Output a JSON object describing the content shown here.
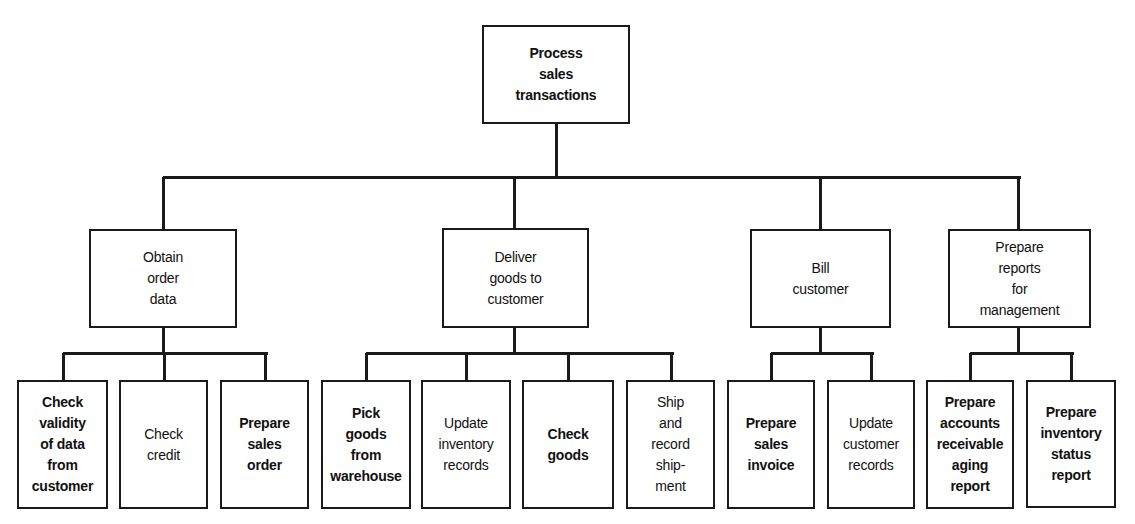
{
  "diagram": {
    "type": "hierarchy-chart",
    "line_color": "#1a1a1a",
    "root": {
      "label": "Process\nsales\ntransactions",
      "box": [
        482,
        25,
        148,
        99
      ]
    },
    "level1": [
      {
        "label": "Obtain\norder\ndata",
        "box": [
          89,
          229,
          148,
          99
        ],
        "connector_x": 163,
        "children": [
          {
            "label": "Check\nvalidity\nof data\nfrom\ncustomer",
            "box": [
              17,
              380,
              91,
              129
            ],
            "bold": true
          },
          {
            "label": "Check\ncredit",
            "box": [
              119,
              380,
              89,
              129
            ],
            "bold": false
          },
          {
            "label": "Prepare\nsales\norder",
            "box": [
              220,
              380,
              89,
              129
            ],
            "bold": true
          }
        ]
      },
      {
        "label": "Deliver\ngoods to\ncustomer",
        "box": [
          442,
          228,
          147,
          100
        ],
        "connector_x": 514,
        "children": [
          {
            "label": "Pick\ngoods\nfrom\nwarehouse",
            "box": [
              321,
              380,
              90,
              129
            ],
            "bold": true
          },
          {
            "label": "Update\ninventory\nrecords",
            "box": [
              421,
              380,
              90,
              129
            ],
            "bold": false
          },
          {
            "label": "Check\ngoods",
            "box": [
              522,
              380,
              92,
              129
            ],
            "bold": true
          },
          {
            "label": "Ship\nand\nrecord\nship-\nment",
            "box": [
              626,
              380,
              89,
              129
            ],
            "bold": false
          }
        ]
      },
      {
        "label": "Bill\ncustomer",
        "box": [
          750,
          229,
          141,
          99
        ],
        "connector_x": 820,
        "children": [
          {
            "label": "Prepare\nsales\ninvoice",
            "box": [
              727,
              380,
              88,
              129
            ],
            "bold": true
          },
          {
            "label": "Update\ncustomer\nrecords",
            "box": [
              827,
              380,
              88,
              129
            ],
            "bold": false
          }
        ]
      },
      {
        "label": "Prepare\nreports\nfor\nmanagement",
        "box": [
          948,
          229,
          143,
          99
        ],
        "connector_x": 1018,
        "children": [
          {
            "label": "Prepare\naccounts\nreceivable\naging\nreport",
            "box": [
              926,
              380,
              88,
              129
            ],
            "bold": true
          },
          {
            "label": "Prepare\ninventory\nstatus\nreport",
            "box": [
              1026,
              380,
              90,
              128
            ],
            "bold": true
          }
        ]
      }
    ],
    "main_bus_y": 177,
    "sub_bus_y": 353
  }
}
